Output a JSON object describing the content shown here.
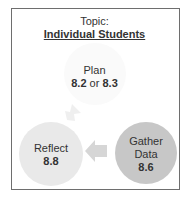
{
  "header": {
    "topic_label": "Topic:",
    "topic_title": "Individual Students"
  },
  "cycle": {
    "plan": {
      "label": "Plan",
      "num_a": "8.2",
      "connector": " or ",
      "num_b": "8.3"
    },
    "reflect": {
      "label": "Reflect",
      "num": "8.8"
    },
    "gather": {
      "label_line1": "Gather",
      "label_line2": "Data",
      "num": "8.6"
    }
  },
  "colors": {
    "frame": "#6e6e6e",
    "plan_circle": "#fafafa",
    "reflect_circle": "#e9e9e9",
    "gather_circle": "#c7c7c7",
    "arrow_left": "#d6d6d6",
    "arrow_up": "#efefef"
  }
}
